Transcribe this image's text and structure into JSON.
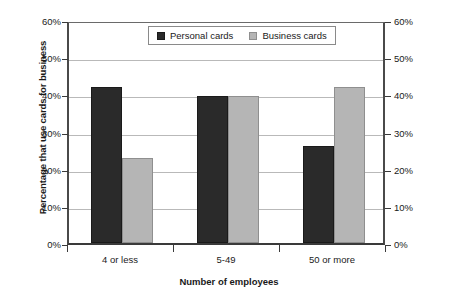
{
  "chart_data": {
    "type": "bar",
    "title": "",
    "categories": [
      "4 or less",
      "5-49",
      "50 or more"
    ],
    "series": [
      {
        "name": "Personal cards",
        "color": "#2a2a2a",
        "values": [
          42,
          39.5,
          26
        ]
      },
      {
        "name": "Business cards",
        "color": "#b5b5b5",
        "values": [
          23,
          39.5,
          42
        ]
      }
    ],
    "xlabel": "Number of employees",
    "ylabel": "Percentage that use cards for business",
    "ylabel_right": "",
    "ylim": [
      0,
      60
    ],
    "ytick_labels": [
      "0%",
      "10%",
      "20%",
      "30%",
      "40%",
      "50%",
      "60%"
    ],
    "ytick_values": [
      0,
      10,
      20,
      30,
      40,
      50,
      60
    ],
    "grid": true,
    "legend_position": "top-center",
    "dual_axis": true
  },
  "legend": {
    "entries": [
      {
        "label": "Personal cards",
        "swatch": "dark-square-swatch"
      },
      {
        "label": "Business cards",
        "swatch": "light-square-swatch"
      }
    ]
  }
}
